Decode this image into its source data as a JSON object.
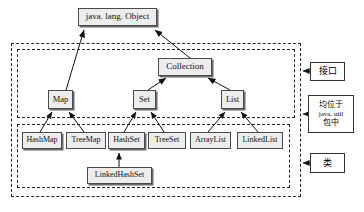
{
  "diagram": {
    "root": {
      "label": "java. lang. Object"
    },
    "interfaces": [
      {
        "id": "collection",
        "label": "Collection"
      },
      {
        "id": "map",
        "label": "Map"
      },
      {
        "id": "set",
        "label": "Set"
      },
      {
        "id": "list",
        "label": "List"
      }
    ],
    "classes": [
      {
        "id": "hashmap",
        "label": "HashMap"
      },
      {
        "id": "treemap",
        "label": "TreeMap"
      },
      {
        "id": "hashset",
        "label": "HashSet"
      },
      {
        "id": "treeset",
        "label": "TreeSet"
      },
      {
        "id": "arraylist",
        "label": "ArrayList"
      },
      {
        "id": "linkedlist",
        "label": "LinkedList"
      },
      {
        "id": "linkedhashset",
        "label": "LinkedHashSet"
      }
    ],
    "annotations": [
      {
        "id": "interface-annotation",
        "lines": [
          "接口"
        ]
      },
      {
        "id": "package-annotation",
        "lines": [
          "均位于",
          "java. util",
          "包中"
        ]
      },
      {
        "id": "class-annotation",
        "lines": [
          "类"
        ]
      }
    ],
    "groups": [
      {
        "id": "outer-group",
        "label": "java.util package group"
      },
      {
        "id": "interface-group",
        "label": "interfaces group"
      },
      {
        "id": "class-group",
        "label": "classes group"
      }
    ],
    "colors": {
      "node_fill": "#ededed",
      "node_border": "#4a4a4a",
      "dashed_border": "#222222",
      "line": "#111111",
      "background": "#ffffff"
    }
  }
}
